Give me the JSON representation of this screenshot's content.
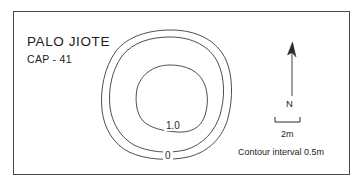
{
  "map": {
    "site_name": "PALO JIOTE",
    "site_code": "CAP - 41",
    "contour_labels": {
      "inner": "1.0",
      "outer": "0"
    },
    "north_arrow": {
      "label": "N",
      "icon": "north-arrow-icon"
    },
    "scale_bar": {
      "label": "2m",
      "icon": "scale-bar-icon"
    },
    "legend": {
      "contour_interval": "Contour interval 0.5m"
    },
    "colors": {
      "frame": "#4a4a4a",
      "contour_line": "#3a3a3a",
      "text": "#1c1c1c",
      "background": "#ffffff"
    }
  }
}
